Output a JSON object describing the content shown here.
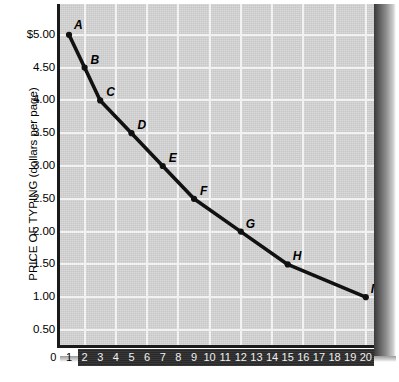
{
  "chart_data": {
    "type": "line",
    "title": "",
    "subtitle": "",
    "xlabel": "",
    "ylabel": "PRICE OF TYPING (dollars per page)",
    "xlim": [
      0,
      20
    ],
    "ylim": [
      0,
      5.25
    ],
    "grid": true,
    "legend": null,
    "x": [
      1,
      3,
      5,
      7,
      9,
      12,
      15,
      20
    ],
    "series": [
      {
        "name": "Demand for typing",
        "points": [
          {
            "label": "A",
            "x": 1,
            "y": 5.0
          },
          {
            "label": "B",
            "x": 2,
            "y": 4.5
          },
          {
            "label": "C",
            "x": 3,
            "y": 4.0
          },
          {
            "label": "D",
            "x": 5,
            "y": 3.5
          },
          {
            "label": "E",
            "x": 7,
            "y": 3.0
          },
          {
            "label": "F",
            "x": 9,
            "y": 2.5
          },
          {
            "label": "G",
            "x": 12,
            "y": 2.0
          },
          {
            "label": "H",
            "x": 15,
            "y": 1.5
          },
          {
            "label": "I",
            "x": 20,
            "y": 1.0
          }
        ]
      }
    ],
    "y_tick_labels": [
      "$5.00",
      "4.50",
      "4.00",
      "3.50",
      "3.00",
      "2.50",
      "2.00",
      "1.50",
      "1.00",
      "0.50"
    ],
    "y_tick_values": [
      5.0,
      4.5,
      4.0,
      3.5,
      3.0,
      2.5,
      2.0,
      1.5,
      1.0,
      0.5
    ],
    "x_tick_labels": [
      "0",
      "1",
      "2",
      "3",
      "4",
      "5",
      "6",
      "7",
      "8",
      "9",
      "10",
      "11",
      "12",
      "13",
      "14",
      "15",
      "16",
      "17",
      "18",
      "19",
      "20"
    ],
    "x_tick_values": [
      0,
      1,
      2,
      3,
      4,
      5,
      6,
      7,
      8,
      9,
      10,
      11,
      12,
      13,
      14,
      15,
      16,
      17,
      18,
      19,
      20
    ],
    "colors": {
      "plot_background": "#d5d5d5",
      "gridline": "#f2f2f2",
      "axis": "#1a1a1a",
      "curve": "#111111",
      "axis_band": "#2e2e2e",
      "axis_band_text": "#f0f0f0",
      "text": "#000000"
    }
  }
}
